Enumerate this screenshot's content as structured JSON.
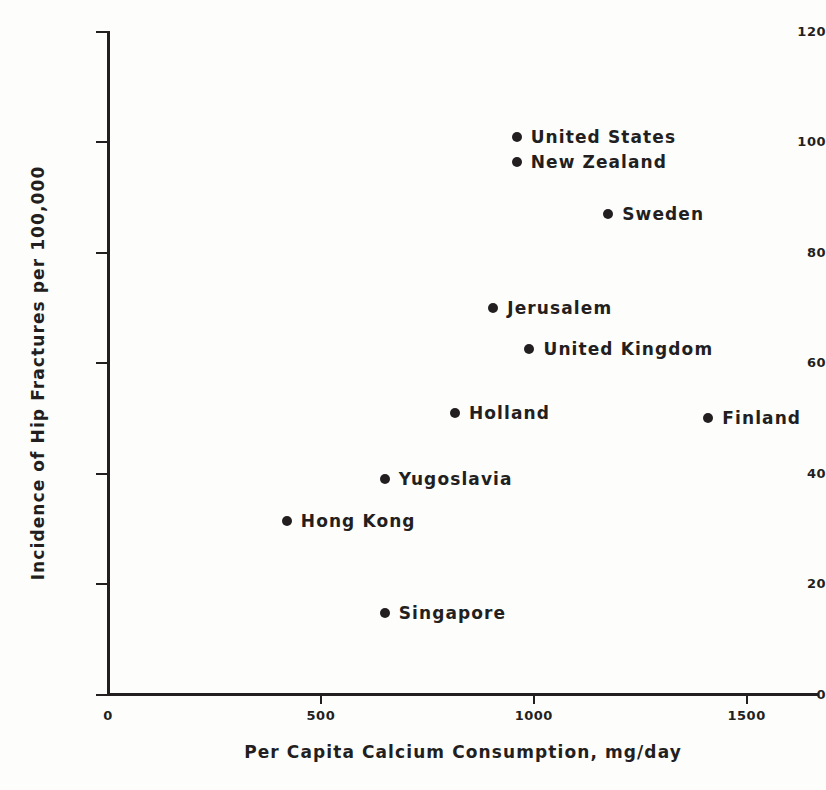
{
  "chart_data": {
    "type": "scatter",
    "title": "",
    "xlabel": "Per Capita Calcium Consumption, mg/day",
    "ylabel": "Incidence of Hip Fractures per 100,000",
    "xlim": [
      0,
      1670
    ],
    "ylim": [
      0,
      120
    ],
    "grid": false,
    "legend": "none",
    "xticks": [
      {
        "value": 0,
        "label": "0"
      },
      {
        "value": 500,
        "label": "500"
      },
      {
        "value": 1000,
        "label": "1000"
      },
      {
        "value": 1500,
        "label": "1500"
      }
    ],
    "yticks": [
      {
        "value": 0,
        "label": "0"
      },
      {
        "value": 20,
        "label": "20"
      },
      {
        "value": 40,
        "label": "40"
      },
      {
        "value": 60,
        "label": "60"
      },
      {
        "value": 80,
        "label": "80"
      },
      {
        "value": 100,
        "label": "100"
      },
      {
        "value": 120,
        "label": "120"
      }
    ],
    "points": [
      {
        "label": "United States",
        "x": 960,
        "y": 101.0
      },
      {
        "label": "New Zealand",
        "x": 960,
        "y": 96.5
      },
      {
        "label": "Sweden",
        "x": 1175,
        "y": 87.0
      },
      {
        "label": "Jerusalem",
        "x": 905,
        "y": 70.0
      },
      {
        "label": "United Kingdom",
        "x": 990,
        "y": 62.5
      },
      {
        "label": "Holland",
        "x": 815,
        "y": 51.0
      },
      {
        "label": "Finland",
        "x": 1410,
        "y": 50.0
      },
      {
        "label": "Yugoslavia",
        "x": 650,
        "y": 39.0
      },
      {
        "label": "Hong Kong",
        "x": 420,
        "y": 31.5
      },
      {
        "label": "Singapore",
        "x": 650,
        "y": 14.8
      }
    ],
    "colors": {
      "marker": "#231f20",
      "axis": "#231f20",
      "text": "#231f20",
      "background": "#fdfdfc"
    }
  }
}
